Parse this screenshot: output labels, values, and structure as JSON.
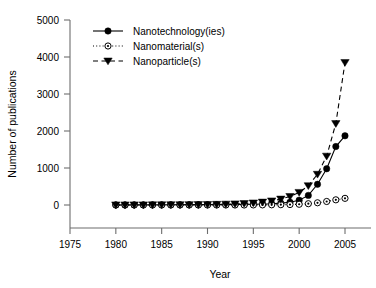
{
  "chart_data": {
    "type": "line",
    "title": "",
    "xlabel": "Year",
    "ylabel": "Number of publications",
    "xlim": [
      1975,
      2005
    ],
    "ylim": [
      0,
      5000
    ],
    "xticks": [
      1975,
      1980,
      1985,
      1990,
      1995,
      2000,
      2005
    ],
    "yticks": [
      0,
      1000,
      2000,
      3000,
      4000,
      5000
    ],
    "grid": false,
    "legend_position": "top-left-inside",
    "x": [
      1980,
      1981,
      1982,
      1983,
      1984,
      1985,
      1986,
      1987,
      1988,
      1989,
      1990,
      1991,
      1992,
      1993,
      1994,
      1995,
      1996,
      1997,
      1998,
      1999,
      2000,
      2001,
      2002,
      2003,
      2004,
      2005
    ],
    "series": [
      {
        "name": "Nanotechnology(ies)",
        "marker": "filled-circle",
        "line_style": "solid",
        "color": "#000000",
        "values": [
          2,
          2,
          3,
          3,
          4,
          4,
          5,
          5,
          6,
          7,
          8,
          9,
          11,
          13,
          16,
          20,
          26,
          35,
          50,
          75,
          130,
          260,
          560,
          980,
          1580,
          1870
        ]
      },
      {
        "name": "Nanomaterial(s)",
        "marker": "open-circle-dot",
        "line_style": "dotted",
        "color": "#000000",
        "values": [
          0,
          0,
          0,
          0,
          0,
          0,
          0,
          0,
          0,
          0,
          0,
          0,
          0,
          0,
          0,
          2,
          3,
          5,
          8,
          12,
          20,
          35,
          60,
          95,
          140,
          180
        ]
      },
      {
        "name": "Nanoparticle(s)",
        "marker": "filled-triangle-down",
        "line_style": "dashed",
        "color": "#000000",
        "values": [
          2,
          2,
          3,
          3,
          4,
          5,
          6,
          7,
          9,
          11,
          14,
          18,
          23,
          30,
          40,
          55,
          78,
          110,
          160,
          230,
          340,
          520,
          830,
          1320,
          2200,
          3850
        ]
      }
    ]
  },
  "legend": {
    "entries": [
      {
        "label": "Nanotechnology(ies)"
      },
      {
        "label": "Nanomaterial(s)"
      },
      {
        "label": "Nanoparticle(s)"
      }
    ]
  }
}
